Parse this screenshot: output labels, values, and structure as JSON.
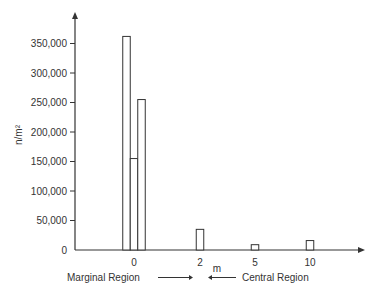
{
  "chart_data": {
    "type": "bar",
    "title": "",
    "xlabel": "m",
    "ylabel": "n/m²",
    "ylim": [
      0,
      400000
    ],
    "yticks": [
      0,
      50000,
      100000,
      150000,
      200000,
      250000,
      300000,
      350000
    ],
    "ytick_labels": [
      "0",
      "50,000",
      "100,000",
      "150,000",
      "200,000",
      "250,000",
      "300,000",
      "350,000"
    ],
    "xticks": [
      {
        "label": "0",
        "pos": 0
      },
      {
        "label": "2",
        "pos": 2
      },
      {
        "label": "5",
        "pos": 5
      },
      {
        "label": "10",
        "pos": 10
      }
    ],
    "bars": [
      {
        "group": "0",
        "offset": -1,
        "value": 362000
      },
      {
        "group": "0",
        "offset": 0,
        "value": 155000
      },
      {
        "group": "0",
        "offset": 1,
        "value": 255000
      },
      {
        "group": "2",
        "offset": 0,
        "value": 35000
      },
      {
        "group": "5",
        "offset": 0,
        "value": 9000
      },
      {
        "group": "10",
        "offset": 0,
        "value": 16000
      }
    ],
    "annotations": [
      {
        "text": "Marginal Region",
        "arrow": "right"
      },
      {
        "text": "Central Region",
        "arrow": "left"
      }
    ],
    "grid": false,
    "legend": "none"
  }
}
